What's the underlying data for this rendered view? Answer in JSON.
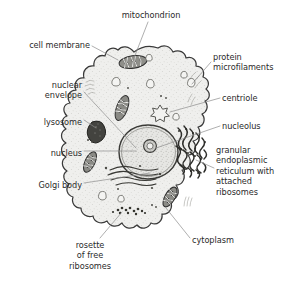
{
  "diagram": {
    "background_color": "#ffffff",
    "ink_color": "#2b2b2b",
    "cytoplasm_fill": "#eeeeec",
    "leader_line_color": "#8c8c8c",
    "membrane_color": "#3a3a3a"
  },
  "labels": [
    {
      "id": "mitochondrion",
      "text": "mitochondrion",
      "align": "center",
      "x": 106,
      "y": 10,
      "width": 90
    },
    {
      "id": "cell-membrane",
      "text": "cell membrane",
      "align": "right",
      "x": 8,
      "y": 40,
      "width": 82
    },
    {
      "id": "protein-microfilaments",
      "text": "protein\nmicrofilaments",
      "align": "left",
      "x": 213,
      "y": 52,
      "width": 78
    },
    {
      "id": "nuclear-envelope",
      "text": "nuclear\nenvelope",
      "align": "right",
      "x": 10,
      "y": 80,
      "width": 72
    },
    {
      "id": "centriole",
      "text": "centriole",
      "align": "left",
      "x": 222,
      "y": 93,
      "width": 70
    },
    {
      "id": "lysosome",
      "text": "lysosome",
      "align": "right",
      "x": 8,
      "y": 117,
      "width": 74
    },
    {
      "id": "nucleolus",
      "text": "nucleolus",
      "align": "left",
      "x": 222,
      "y": 121,
      "width": 70
    },
    {
      "id": "nucleus",
      "text": "nucleus",
      "align": "right",
      "x": 14,
      "y": 148,
      "width": 68
    },
    {
      "id": "granular-er",
      "text": "granular\nendoplasmic\nreticulum with\nattached\nribosomes",
      "align": "left",
      "x": 216,
      "y": 145,
      "width": 78
    },
    {
      "id": "golgi-body",
      "text": "Golgi body",
      "align": "right",
      "x": 6,
      "y": 180,
      "width": 76
    },
    {
      "id": "cytoplasm",
      "text": "cytoplasm",
      "align": "left",
      "x": 192,
      "y": 235,
      "width": 70
    },
    {
      "id": "rosette-of-free-ribosomes",
      "text": "rosette\nof free\nribosomes",
      "align": "center",
      "x": 52,
      "y": 240,
      "width": 76
    }
  ],
  "leader_lines": [
    {
      "id": "leader-mitochondrion",
      "x1": 148,
      "y1": 22,
      "x2": 134,
      "y2": 60
    },
    {
      "id": "leader-cell-membrane",
      "x1": 92,
      "y1": 46,
      "x2": 117,
      "y2": 60
    },
    {
      "id": "leader-protein-microfilaments",
      "x1": 211,
      "y1": 62,
      "x2": 192,
      "y2": 83
    },
    {
      "id": "leader-nuclear-envelope",
      "x1": 84,
      "y1": 92,
      "x2": 137,
      "y2": 150
    },
    {
      "id": "leader-centriole",
      "x1": 220,
      "y1": 98,
      "x2": 172,
      "y2": 113
    },
    {
      "id": "leader-lysosome",
      "x1": 84,
      "y1": 120,
      "x2": 98,
      "y2": 130
    },
    {
      "id": "leader-nucleolus",
      "x1": 220,
      "y1": 126,
      "x2": 148,
      "y2": 150
    },
    {
      "id": "leader-nucleus",
      "x1": 84,
      "y1": 151,
      "x2": 138,
      "y2": 151
    },
    {
      "id": "leader-granular-er",
      "x1": 214,
      "y1": 168,
      "x2": 192,
      "y2": 160
    },
    {
      "id": "leader-golgi-body",
      "x1": 84,
      "y1": 183,
      "x2": 152,
      "y2": 172
    },
    {
      "id": "leader-cytoplasm",
      "x1": 190,
      "y1": 238,
      "x2": 168,
      "y2": 209
    },
    {
      "id": "leader-rosette",
      "x1": 100,
      "y1": 238,
      "x2": 122,
      "y2": 212
    }
  ],
  "organelles": {
    "mitochondria": [
      {
        "id": "mitochondrion-top",
        "cx": 133,
        "cy": 62,
        "rx": 14,
        "ry": 6,
        "rot": -8
      },
      {
        "id": "mitochondrion-mid",
        "cx": 122,
        "cy": 108,
        "rx": 6,
        "ry": 13,
        "rot": 20
      },
      {
        "id": "mitochondrion-left",
        "cx": 90,
        "cy": 162,
        "rx": 5,
        "ry": 11,
        "rot": 25
      },
      {
        "id": "mitochondrion-bottom",
        "cx": 170,
        "cy": 197,
        "rx": 5,
        "ry": 11,
        "rot": 30
      }
    ],
    "vacuoles": [
      {
        "id": "vacuole-1",
        "cx": 117,
        "cy": 82,
        "r": 4
      },
      {
        "id": "vacuole-2",
        "cx": 150,
        "cy": 58,
        "r": 3
      },
      {
        "id": "vacuole-3",
        "cx": 152,
        "cy": 84,
        "r": 4
      },
      {
        "id": "vacuole-4",
        "cx": 185,
        "cy": 75,
        "r": 3
      },
      {
        "id": "vacuole-5",
        "cx": 192,
        "cy": 83,
        "r": 4
      },
      {
        "id": "vacuole-6",
        "cx": 177,
        "cy": 117,
        "r": 3
      },
      {
        "id": "vacuole-7",
        "cx": 103,
        "cy": 196,
        "r": 4
      },
      {
        "id": "vacuole-8",
        "cx": 121,
        "cy": 199,
        "r": 3
      }
    ],
    "centriole": {
      "id": "centriole-shape",
      "cx": 160,
      "cy": 112,
      "r": 6
    },
    "lysosome": {
      "id": "lysosome-shape",
      "cx": 97,
      "cy": 131,
      "rx": 8,
      "ry": 10
    },
    "nucleus": {
      "id": "nucleus-shape",
      "cx": 148,
      "cy": 152,
      "rx": 29,
      "ry": 27
    },
    "nucleolus": {
      "id": "nucleolus-shape",
      "cx": 150,
      "cy": 146,
      "r": 6
    }
  }
}
